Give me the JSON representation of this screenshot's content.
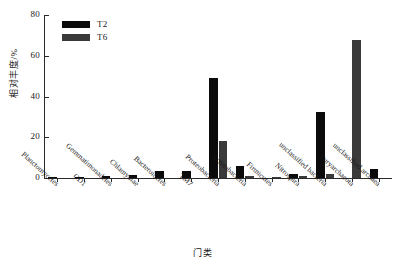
{
  "chart_data": {
    "type": "bar",
    "title": "",
    "xlabel": "门类",
    "ylabel": "相对丰度/%",
    "ylim": [
      0,
      80
    ],
    "yticks": [
      0,
      20,
      40,
      60,
      80
    ],
    "grid": false,
    "legend_position": "top-left",
    "categories": [
      "Planctomycetes",
      "OD1",
      "Gemmatimonadetes",
      "Chlamydiae",
      "Bacteroidetes",
      "TM7",
      "Proteobacteria",
      "Actinobacteria",
      "Firmicutes",
      "Nitrospira",
      "unclassified bacteria",
      "Euryarchaeota",
      "unclassified archaea"
    ],
    "series": [
      {
        "name": "T2",
        "color": "#0b0b0b",
        "values": [
          0.3,
          0.5,
          0.8,
          1.5,
          3.5,
          3.5,
          49.0,
          6.0,
          0.0,
          2.0,
          32.5,
          0.0,
          4.5
        ]
      },
      {
        "name": "T6",
        "color": "#3a3a3a",
        "values": [
          0.0,
          0.0,
          0.0,
          0.0,
          0.0,
          0.0,
          18.0,
          1.0,
          0.6,
          1.2,
          2.0,
          67.5,
          0.0
        ]
      }
    ]
  },
  "legend": {
    "items": [
      {
        "label": "T2",
        "color": "#0b0b0b"
      },
      {
        "label": "T6",
        "color": "#3a3a3a"
      }
    ]
  },
  "axis": {
    "y_tick_labels": [
      "0",
      "20",
      "40",
      "60",
      "80"
    ],
    "y_title": "相对丰度/%",
    "x_title": "门类"
  }
}
